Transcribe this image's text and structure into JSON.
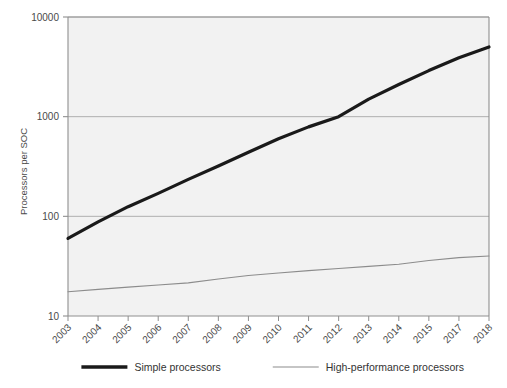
{
  "chart_data": {
    "type": "line",
    "title": "",
    "xlabel": "",
    "ylabel": "Processors per SOC",
    "yscale": "log",
    "ylim": [
      10,
      10000
    ],
    "ytick_labels": [
      "10000",
      "1000",
      "100",
      "10"
    ],
    "ytick_values": [
      10000,
      1000,
      100,
      10
    ],
    "grid": true,
    "grid_axis": "y",
    "legend_position": "bottom",
    "categories": [
      "2003",
      "2004",
      "2005",
      "2006",
      "2007",
      "2008",
      "2009",
      "2010",
      "2011",
      "2012",
      "2013",
      "2014",
      "2015",
      "2017",
      "2018"
    ],
    "x": [
      2003,
      2004,
      2005,
      2006,
      2007,
      2008,
      2009,
      2010,
      2011,
      2012,
      2013,
      2014,
      2015,
      2017,
      2018
    ],
    "series": [
      {
        "name": "Simple processors",
        "color": "#1a1a1a",
        "width": 3.2,
        "values": [
          60,
          88,
          125,
          170,
          235,
          320,
          440,
          600,
          790,
          1000,
          1500,
          2100,
          2900,
          3900,
          5000
        ]
      },
      {
        "name": "High-performance processors",
        "color": "#8c8c8c",
        "width": 1.1,
        "values": [
          17.5,
          18.5,
          19.5,
          20.5,
          21.5,
          23.5,
          25.5,
          27,
          28.5,
          30,
          31.5,
          33,
          36,
          38.5,
          40
        ]
      }
    ]
  },
  "axes": {
    "ylabel": "Processors per SOC",
    "ytick_labels": [
      "10000",
      "1000",
      "100",
      "10"
    ],
    "xtick_labels": [
      "2003",
      "2004",
      "2005",
      "2006",
      "2007",
      "2008",
      "2009",
      "2010",
      "2011",
      "2012",
      "2013",
      "2014",
      "2015",
      "2017",
      "2018"
    ]
  },
  "legend": {
    "items": [
      {
        "label": "Simple processors",
        "color": "#1a1a1a",
        "width": 3.4
      },
      {
        "label": "High-performance processors",
        "color": "#8c8c8c",
        "width": 1.2
      }
    ]
  },
  "colors": {
    "plot_background": "#f2f2f2",
    "grid": "#a8a8a8",
    "axis": "#8f8f8f",
    "text": "#4a4a4a",
    "series_simple": "#1a1a1a",
    "series_highperf": "#8c8c8c"
  }
}
